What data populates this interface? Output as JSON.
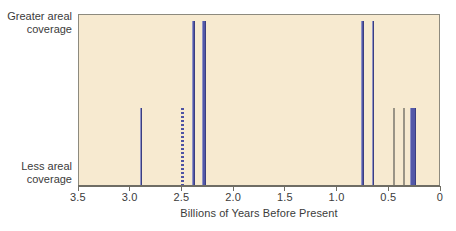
{
  "chart_data": {
    "type": "bar",
    "title": "",
    "subtitle": "",
    "xlabel": "Billions of Years Before Present",
    "ylabel": "",
    "ylabel_top": "Greater areal\ncoverage",
    "ylabel_bottom": "Less areal\ncoverage",
    "xlim": [
      3.5,
      0.0
    ],
    "x_axis_inverted": true,
    "ylim": [
      0,
      1
    ],
    "grid": false,
    "legend": null,
    "x_tick_values": [
      3.5,
      3.0,
      2.5,
      2.0,
      1.5,
      1.0,
      0.5,
      0.0
    ],
    "x_tick_labels": [
      "3.5",
      "3.0",
      "2.5",
      "2.0",
      "1.5",
      "1.0",
      "0.5",
      "0"
    ],
    "y_tick_values": [
      0,
      1
    ],
    "y_tick_labels": [
      "Less areal coverage",
      "Greater areal coverage"
    ],
    "bar_color": "#5358a8",
    "plot_background": "#f7ead0",
    "figure_background": "#ffffff",
    "axis_color": "#6f6d64",
    "text_color": "#3b3b3b",
    "note": "Glaciation events: bar position = age in billions of years before present, bar height = relative areal coverage of glacial ice.",
    "bars": [
      {
        "label": "glaciation-2.9",
        "x": 2.9,
        "value": 0.47,
        "width_ga": 0.022,
        "style": "solid"
      },
      {
        "label": "glaciation-2.50",
        "x": 2.5,
        "value": 0.47,
        "width_ga": 0.026,
        "style": "dashed"
      },
      {
        "label": "glaciation-2.39",
        "x": 2.39,
        "value": 1.0,
        "width_ga": 0.03,
        "style": "solid"
      },
      {
        "label": "glaciation-2.29",
        "x": 2.29,
        "value": 1.0,
        "width_ga": 0.032,
        "style": "solid"
      },
      {
        "label": "glaciation-0.76",
        "x": 0.76,
        "value": 1.0,
        "width_ga": 0.022,
        "style": "solid"
      },
      {
        "label": "glaciation-0.66",
        "x": 0.66,
        "value": 1.0,
        "width_ga": 0.022,
        "style": "solid"
      },
      {
        "label": "glaciation-0.45",
        "x": 0.45,
        "value": 0.47,
        "width_ga": 0.01,
        "style": "hairline"
      },
      {
        "label": "glaciation-0.36",
        "x": 0.36,
        "value": 0.47,
        "width_ga": 0.01,
        "style": "hairline"
      },
      {
        "label": "glaciation-0.30",
        "x": 0.27,
        "value": 0.47,
        "width_ga": 0.065,
        "style": "solid"
      },
      {
        "label": "glaciation-0.00",
        "x": 0.01,
        "value": 0.47,
        "width_ga": 0.012,
        "style": "hairline"
      }
    ]
  }
}
